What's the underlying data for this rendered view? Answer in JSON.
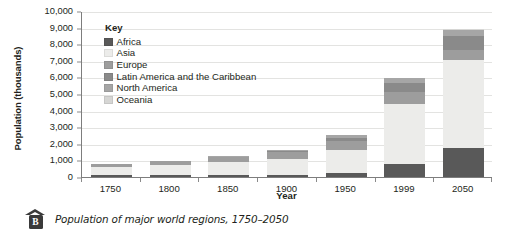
{
  "caption": {
    "marker": "B",
    "text": "Population of major world regions, 1750–2050"
  },
  "legend": {
    "title": "Key",
    "items": [
      {
        "label": "Africa",
        "color": "#595959"
      },
      {
        "label": "Asia",
        "color": "#ececea"
      },
      {
        "label": "Europe",
        "color": "#9d9d9d"
      },
      {
        "label": "Latin America and the Caribbean",
        "color": "#8a8a8a"
      },
      {
        "label": "North America",
        "color": "#a6a6a6"
      },
      {
        "label": "Oceania",
        "color": "#d6d6d4"
      }
    ]
  },
  "chart_data": {
    "type": "bar",
    "stacked": true,
    "title": "Population of major world regions, 1750–2050",
    "xlabel": "Year",
    "ylabel": "Population (thousands)",
    "categories": [
      "1750",
      "1800",
      "1850",
      "1900",
      "1950",
      "1999",
      "2050"
    ],
    "ylim": [
      0,
      10000
    ],
    "ytick_step": 1000,
    "ytick_labels": [
      "0",
      "1,000",
      "2,000",
      "3,000",
      "4,000",
      "5,000",
      "6,000",
      "7,000",
      "8,000",
      "9,000",
      "10,000"
    ],
    "grid": true,
    "legend_position": "inside-top-left",
    "series": [
      {
        "name": "Africa",
        "color": "#595959",
        "values": [
          106,
          107,
          111,
          133,
          221,
          767,
          1766
        ]
      },
      {
        "name": "Asia",
        "color": "#ececea",
        "values": [
          502,
          635,
          809,
          947,
          1402,
          3634,
          5268
        ]
      },
      {
        "name": "Europe",
        "color": "#9d9d9d",
        "values": [
          163,
          203,
          276,
          408,
          547,
          729,
          628
        ]
      },
      {
        "name": "Latin America and the Caribbean",
        "color": "#8a8a8a",
        "values": [
          16,
          24,
          38,
          74,
          167,
          511,
          809
        ]
      },
      {
        "name": "North America",
        "color": "#a6a6a6",
        "values": [
          2,
          7,
          26,
          82,
          172,
          307,
          392
        ]
      },
      {
        "name": "Oceania",
        "color": "#d6d6d4",
        "values": [
          2,
          2,
          2,
          6,
          13,
          30,
          46
        ]
      }
    ],
    "totals": [
      791,
      978,
      1262,
      1650,
      2522,
      5978,
      8909
    ]
  }
}
